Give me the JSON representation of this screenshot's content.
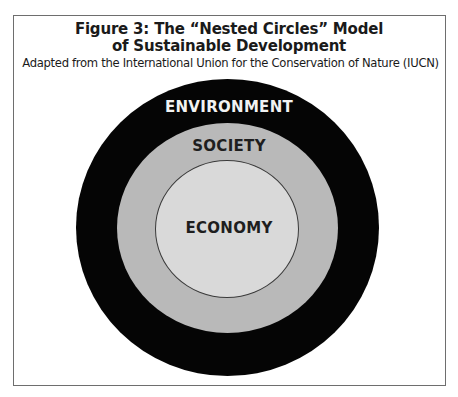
{
  "figure": {
    "title_line1": "Figure 3: The “Nested Circles” Model",
    "title_line2": "of Sustainable Development",
    "subtitle": "Adapted from the International Union for the Conservation of Nature (IUCN)"
  },
  "diagram": {
    "type": "nested-circles",
    "circles": [
      {
        "label": "ENVIRONMENT",
        "fill": "#050505",
        "text_color": "#f2f2f2",
        "level": "outer"
      },
      {
        "label": "SOCIETY",
        "fill": "#b9b9b9",
        "text_color": "#1e1e1e",
        "level": "middle"
      },
      {
        "label": "ECONOMY",
        "fill": "#d9d9d9",
        "text_color": "#1e1e1e",
        "level": "inner"
      }
    ]
  },
  "colors": {
    "frame_border": "#6e6e6e",
    "background": "#ffffff"
  }
}
